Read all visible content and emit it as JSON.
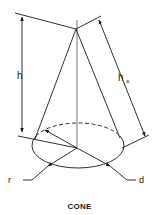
{
  "figure": {
    "title": "CONE",
    "labels": {
      "height": "h",
      "slant_height_main": "h",
      "slant_height_sub": "s",
      "radius": "r",
      "diameter": "d"
    },
    "colors": {
      "line": "#1a1a1a",
      "background": "#ffffff"
    }
  }
}
